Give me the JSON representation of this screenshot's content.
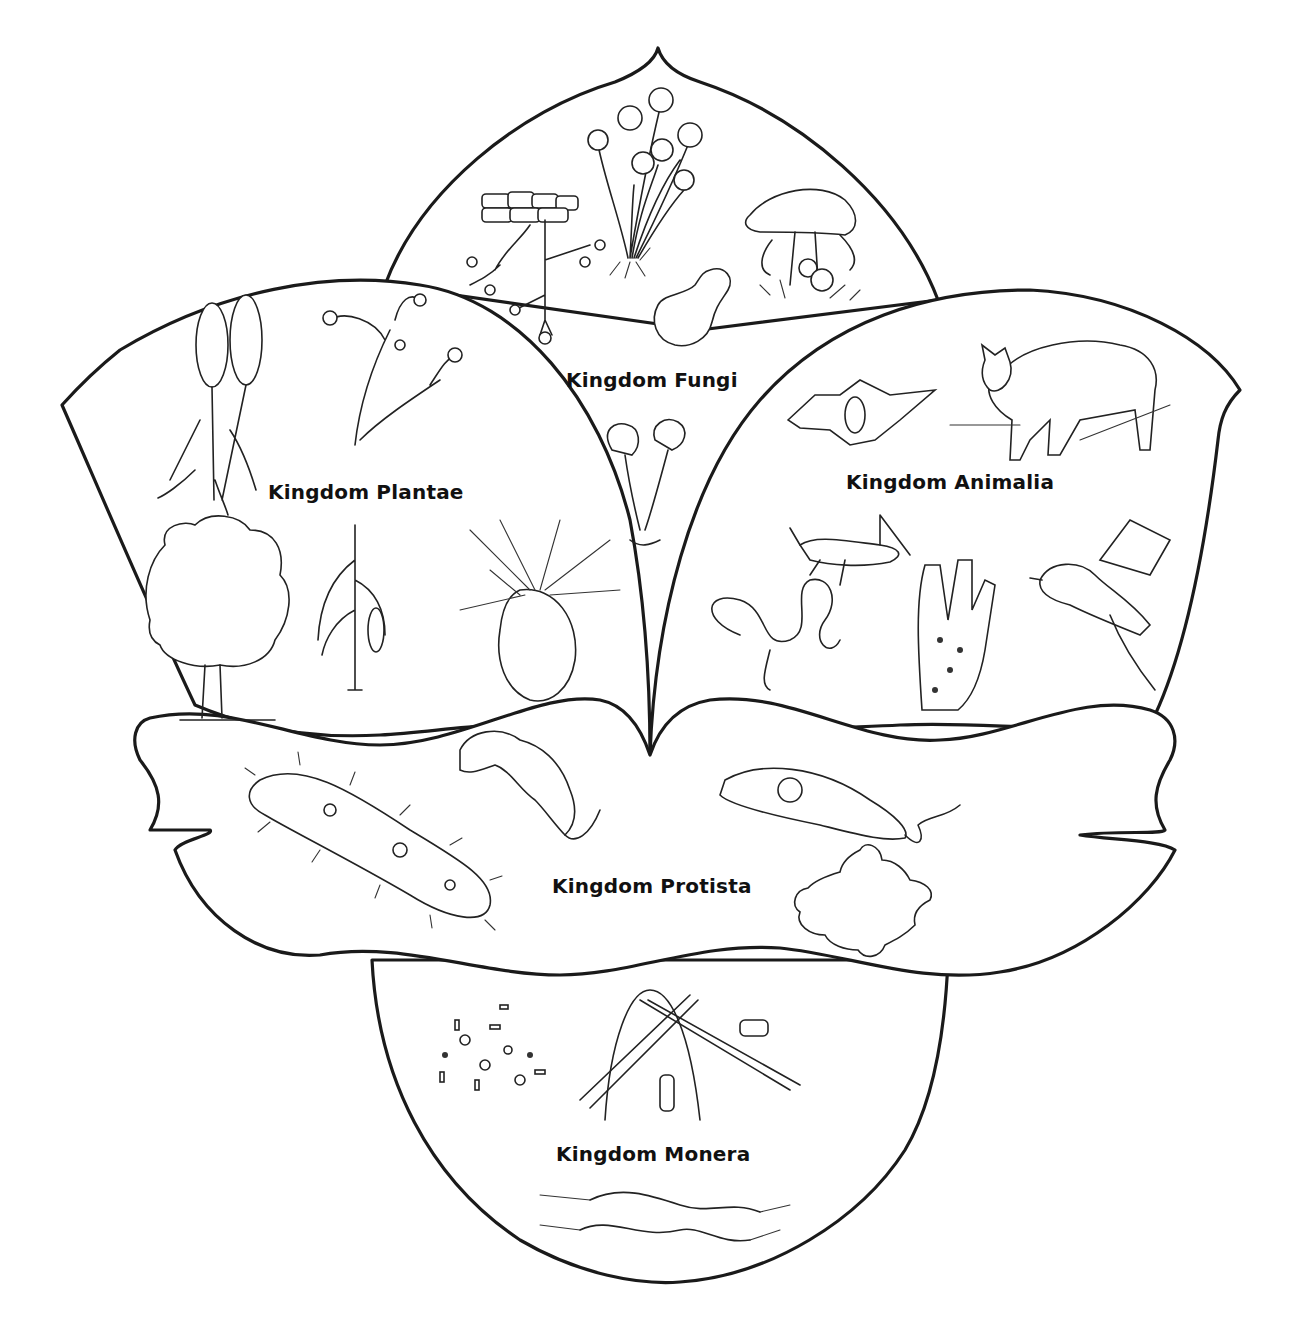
{
  "diagram": {
    "kingdoms": [
      {
        "id": "fungi",
        "label": "Kingdom Fungi",
        "examples": [
          "bread-mold",
          "sporangia-mold",
          "yeast",
          "mushrooms",
          "cup-fungi"
        ]
      },
      {
        "id": "plantae",
        "label": "Kingdom Plantae",
        "examples": [
          "horsetail",
          "liverwort-moss",
          "deciduous-tree",
          "corn-plant",
          "pine-cone"
        ]
      },
      {
        "id": "animalia",
        "label": "Kingdom Animalia",
        "examples": [
          "bat",
          "bobcat",
          "grasshopper",
          "roundworm",
          "sponge",
          "bird"
        ]
      },
      {
        "id": "protista",
        "label": "Kingdom Protista",
        "examples": [
          "paramecium",
          "trypanosome",
          "euglena",
          "amoeba"
        ]
      },
      {
        "id": "monera",
        "label": "Kingdom Monera",
        "examples": [
          "bacteria-cluster",
          "cyanobacteria-filaments",
          "spirochete-bacteria"
        ]
      }
    ]
  },
  "colors": {
    "line": "#1a1a1a",
    "background": "#ffffff"
  }
}
